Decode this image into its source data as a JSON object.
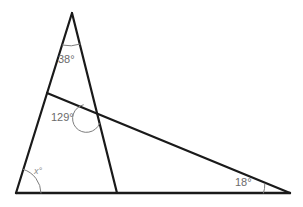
{
  "figure": {
    "background_color": "#ffffff",
    "line_color": "#1a1a1a",
    "arc_color": "#7d7d7d",
    "label_color": "#6b6b6b"
  },
  "angles": {
    "apex": {
      "label": "38°",
      "value": 38,
      "units": "degrees"
    },
    "interior_intersection": {
      "label": "129°",
      "value": 129,
      "units": "degrees"
    },
    "bottom_left": {
      "label": "x°",
      "value": null,
      "units": "degrees"
    },
    "bottom_right": {
      "label": "18°",
      "value": 18,
      "units": "degrees"
    }
  },
  "vertices": {
    "apex": {
      "x": 72,
      "y": 13
    },
    "bottom_left": {
      "x": 16,
      "y": 193
    },
    "bottom_mid": {
      "x": 117,
      "y": 193
    },
    "bottom_right": {
      "x": 290,
      "y": 193
    },
    "transversal_left": {
      "x": 47,
      "y": 93
    },
    "intersection": {
      "x": 96,
      "y": 110
    }
  }
}
